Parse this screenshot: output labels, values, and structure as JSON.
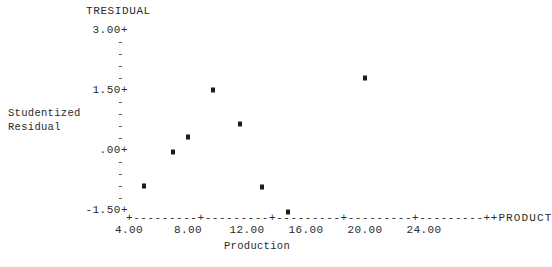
{
  "chart_data": {
    "type": "scatter",
    "title": "TRESIDUAL",
    "xlabel": "Production",
    "ylabel": "Studentized Residual",
    "x_axis_variable": "PRODUCT",
    "xlim": [
      4.0,
      24.0
    ],
    "ylim": [
      -1.5,
      3.0
    ],
    "grid": false,
    "legend": "none",
    "y_ticks_major": [
      "3.00+",
      "1.50+",
      ".00+",
      "-1.50+"
    ],
    "y_tick_values": [
      3.0,
      1.5,
      0.0,
      -1.5
    ],
    "y_minor_marker": "-",
    "x_tick_labels": [
      "4.00",
      "8.00",
      "12.00",
      "16.00",
      "20.00",
      "24.00"
    ],
    "x_tick_values": [
      4.0,
      8.0,
      12.0,
      16.0,
      20.0,
      24.0
    ],
    "axis_line_glyphs": "+---------+---------+---------+---------+---------+",
    "point_marker": "*",
    "points": [
      {
        "x": 5.0,
        "y": -0.9
      },
      {
        "x": 7.0,
        "y": -0.05
      },
      {
        "x": 8.0,
        "y": 0.33
      },
      {
        "x": 9.7,
        "y": 1.5
      },
      {
        "x": 11.5,
        "y": 0.65
      },
      {
        "x": 13.0,
        "y": -0.93
      },
      {
        "x": 14.8,
        "y": -1.55
      },
      {
        "x": 20.0,
        "y": 1.8
      }
    ]
  },
  "axis": {
    "title": "TRESIDUAL",
    "y_caption_line1": "Studentized",
    "y_caption_line2": "Residual",
    "x_caption": "Production",
    "x_variable_label": "PRODUCT",
    "y_labels": [
      {
        "text": "3.00+",
        "kind": "major"
      },
      {
        "text": "-",
        "kind": "minor"
      },
      {
        "text": "-",
        "kind": "minor"
      },
      {
        "text": "-",
        "kind": "minor"
      },
      {
        "text": "-",
        "kind": "minor"
      },
      {
        "text": "1.50+",
        "kind": "major"
      },
      {
        "text": "-",
        "kind": "minor"
      },
      {
        "text": "-",
        "kind": "minor"
      },
      {
        "text": "-",
        "kind": "minor"
      },
      {
        "text": "-",
        "kind": "minor"
      },
      {
        "text": ".00+",
        "kind": "major"
      },
      {
        "text": "-",
        "kind": "minor"
      },
      {
        "text": "-",
        "kind": "minor"
      },
      {
        "text": "-",
        "kind": "minor"
      },
      {
        "text": "-",
        "kind": "minor"
      },
      {
        "text": "-1.50+",
        "kind": "major"
      }
    ],
    "axis_line": "+---------+---------+---------+---------+---------+",
    "colors": {
      "ink": "#2b2b2b",
      "point": "#1d1d1d",
      "background": "#ffffff"
    }
  }
}
